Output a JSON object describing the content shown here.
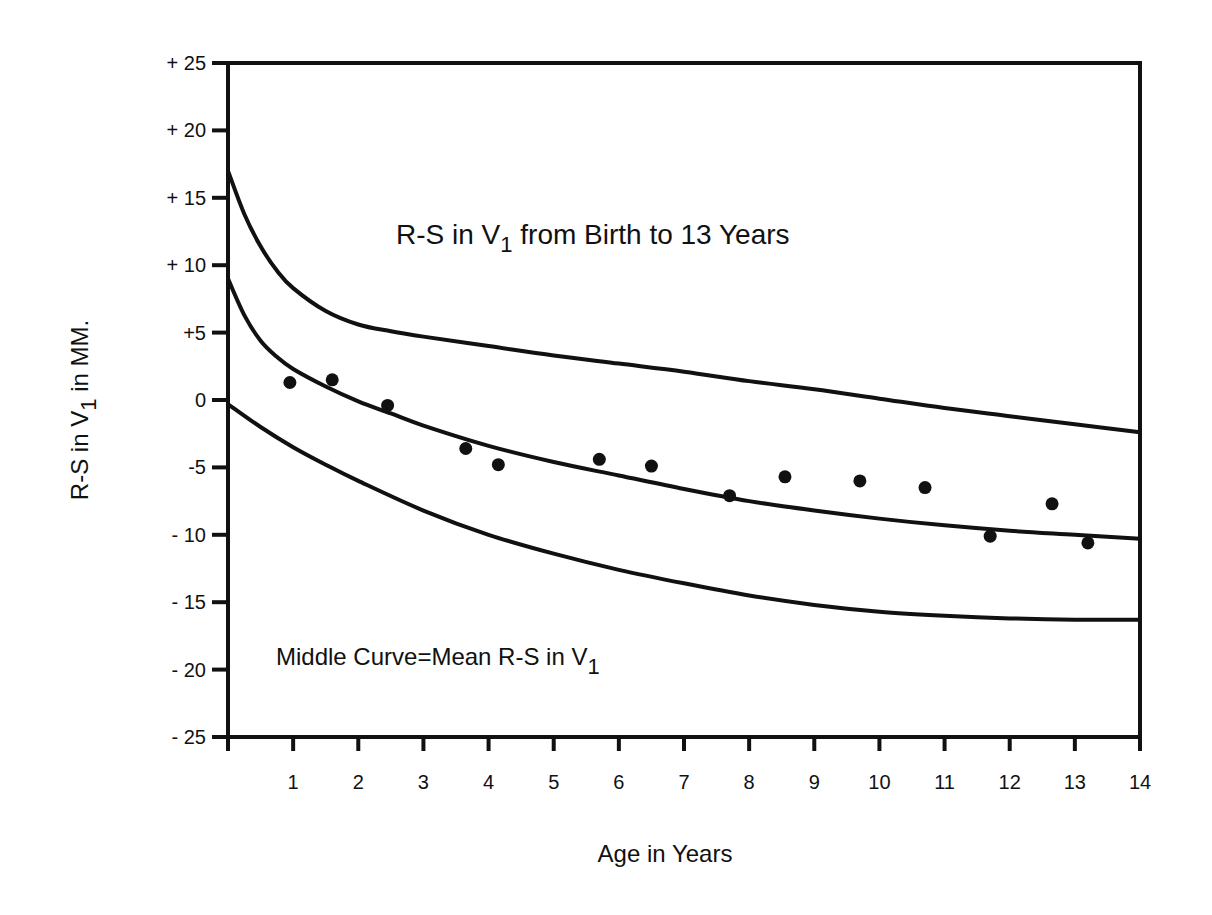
{
  "chart_data": {
    "type": "scatter",
    "title": "R-S in V1 from Birth to 13 Years",
    "title_parts": {
      "pre": "R-S in V",
      "sub": "1",
      "post": " from Birth to 13 Years"
    },
    "annotation": "Middle Curve=Mean R-S in V1",
    "annotation_parts": {
      "pre": "Middle Curve=Mean R-S in V",
      "sub": "1"
    },
    "xlabel": "Age in Years",
    "ylabel": "R-S in V1 in MM.",
    "ylabel_parts": {
      "pre": "R-S in V",
      "sub": "1",
      "post": " in MM."
    },
    "xlim": [
      0,
      14
    ],
    "ylim": [
      -25,
      25
    ],
    "grid": false,
    "legend": null,
    "x_ticks": [
      1,
      2,
      3,
      4,
      5,
      6,
      7,
      8,
      9,
      10,
      11,
      12,
      13,
      14
    ],
    "x_tick_labels": [
      "1",
      "2",
      "3",
      "4",
      "5",
      "6",
      "7",
      "8",
      "9",
      "10",
      "11",
      "12",
      "13",
      "14"
    ],
    "y_ticks": [
      25,
      20,
      15,
      10,
      5,
      0,
      -5,
      -10,
      -15,
      -20,
      -25
    ],
    "y_tick_labels": [
      "+ 25",
      "+ 20",
      "+ 15",
      "+ 10",
      "+5",
      "0",
      "-5",
      "- 10",
      "- 15",
      "- 20",
      "- 25"
    ],
    "series": [
      {
        "name": "Upper curve",
        "kind": "line",
        "x": [
          0,
          0.25,
          0.5,
          0.75,
          1,
          1.5,
          2,
          2.5,
          3,
          4,
          5,
          6,
          7,
          8,
          9,
          10,
          11,
          12,
          13,
          14
        ],
        "y": [
          17,
          13.8,
          11.4,
          9.6,
          8.3,
          6.6,
          5.6,
          5.1,
          4.7,
          4.0,
          3.3,
          2.7,
          2.1,
          1.4,
          0.8,
          0.1,
          -0.6,
          -1.2,
          -1.8,
          -2.4
        ]
      },
      {
        "name": "Mean R-S in V1 (middle curve)",
        "kind": "line",
        "x": [
          0,
          0.25,
          0.5,
          0.75,
          1,
          1.5,
          2,
          2.5,
          3,
          4,
          5,
          6,
          7,
          8,
          9,
          10,
          11,
          12,
          13,
          14
        ],
        "y": [
          9,
          6.3,
          4.4,
          3.2,
          2.3,
          1.0,
          -0.1,
          -1.0,
          -1.9,
          -3.4,
          -4.6,
          -5.6,
          -6.6,
          -7.5,
          -8.2,
          -8.8,
          -9.3,
          -9.7,
          -10.0,
          -10.3
        ]
      },
      {
        "name": "Lower curve",
        "kind": "line",
        "x": [
          0,
          0.5,
          1,
          1.5,
          2,
          3,
          4,
          5,
          6,
          7,
          8,
          9,
          10,
          11,
          12,
          13,
          14
        ],
        "y": [
          -0.3,
          -2.0,
          -3.5,
          -4.8,
          -6.0,
          -8.2,
          -10.0,
          -11.4,
          -12.6,
          -13.6,
          -14.5,
          -15.2,
          -15.7,
          -16.0,
          -16.2,
          -16.3,
          -16.3
        ]
      },
      {
        "name": "Observed values",
        "kind": "scatter",
        "x": [
          0.95,
          1.6,
          2.45,
          3.65,
          4.15,
          5.7,
          6.5,
          7.7,
          8.55,
          9.7,
          10.7,
          11.7,
          12.65,
          13.2
        ],
        "y": [
          1.3,
          1.5,
          -0.4,
          -3.6,
          -4.8,
          -4.4,
          -4.9,
          -7.1,
          -5.7,
          -6.0,
          -6.5,
          -10.1,
          -7.7,
          -10.6
        ]
      }
    ]
  },
  "colors": {
    "ink": "#111111",
    "background": "#ffffff"
  }
}
